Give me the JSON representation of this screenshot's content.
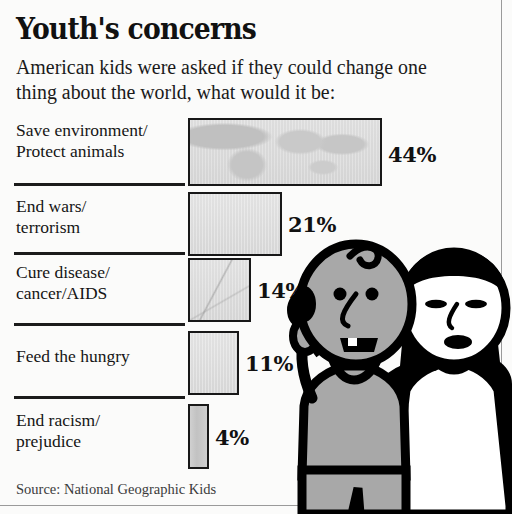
{
  "header": {
    "title": "Youth's concerns",
    "subtitle": "American kids were asked if they could change one thing about the world, what would it be:"
  },
  "source": {
    "text": "Source: National Geographic Kids"
  },
  "colors": {
    "background": "#fbfbfa",
    "ink": "#111111",
    "bar_fill": "#d9d9d9",
    "bar_outline": "#181818",
    "figure_skin_boy": "#a8a8a8",
    "figure_skin_girl": "#ffffff",
    "figure_outline": "#000000",
    "frame_rule": "#9a9a9a"
  },
  "illustration": {
    "name": "two-kids-cartoon",
    "boy": {
      "name": "boy-figure",
      "gesture": "raised-hand",
      "shirt": "gray-tank-top",
      "skin": "#a8a8a8"
    },
    "girl": {
      "name": "girl-figure",
      "hair": "black-bob",
      "dress": "white-dress",
      "skin": "#ffffff"
    }
  },
  "chart_data": {
    "type": "bar",
    "orientation": "horizontal",
    "title": "Youth's concerns",
    "subtitle": "American kids were asked if they could change one thing about the world, what would it be:",
    "xlabel": "",
    "ylabel": "",
    "unit": "%",
    "xlim": [
      0,
      44
    ],
    "grid": false,
    "legend": false,
    "source": "Source: National Geographic Kids",
    "categories": [
      "Save environment/\nProtect animals",
      "End wars/\nterrorism",
      "Cure disease/\ncancer/AIDS",
      "Feed the hungry",
      "End racism/\nprejudice"
    ],
    "values": [
      44,
      21,
      14,
      11,
      4
    ],
    "value_labels": [
      "44%",
      "21%",
      "14%",
      "11%",
      "4%"
    ],
    "rows": [
      {
        "label_line1": "Save environment/",
        "label_line2": "Protect animals",
        "value": 44,
        "value_label": "44%",
        "fill": "world-map-texture",
        "bar": {
          "top": 6,
          "height": 68,
          "width": 194
        },
        "label_top": 8,
        "value_top": 30,
        "divider_top": 71,
        "has_divider": true
      },
      {
        "label_line1": "End wars/",
        "label_line2": "terrorism",
        "value": 21,
        "value_label": "21%",
        "fill": "plain-texture",
        "bar": {
          "top": 80,
          "height": 64,
          "width": 94
        },
        "label_top": 84,
        "value_top": 100,
        "divider_top": 140,
        "has_divider": true
      },
      {
        "label_line1": "Cure disease/",
        "label_line2": "cancer/AIDS",
        "value": 14,
        "value_label": "14%",
        "fill": "faint-map-texture",
        "bar": {
          "top": 146,
          "height": 64,
          "width": 63
        },
        "label_top": 150,
        "value_top": 166,
        "divider_top": 211,
        "has_divider": true
      },
      {
        "label_line1": "Feed the hungry",
        "label_line2": "",
        "value": 11,
        "value_label": "11%",
        "fill": "plain-texture",
        "bar": {
          "top": 219,
          "height": 64,
          "width": 51
        },
        "label_top": 234,
        "value_top": 239,
        "divider_top": 284,
        "has_divider": true
      },
      {
        "label_line1": "End racism/",
        "label_line2": "prejudice",
        "value": 4,
        "value_label": "4%",
        "fill": "slim-fill",
        "bar": {
          "top": 292,
          "height": 65,
          "width": 21
        },
        "label_top": 298,
        "value_top": 313,
        "divider_top": 0,
        "has_divider": false
      }
    ]
  }
}
